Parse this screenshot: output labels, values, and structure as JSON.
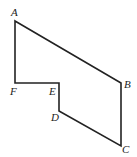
{
  "diagram": {
    "type": "polygon",
    "stroke_color": "#222222",
    "background": "#ffffff",
    "vertices": [
      {
        "id": "A",
        "label": "A",
        "x": 15,
        "y": 21,
        "lx": 11,
        "ly": 16
      },
      {
        "id": "B",
        "label": "B",
        "x": 121,
        "y": 83,
        "lx": 124,
        "ly": 88
      },
      {
        "id": "C",
        "label": "C",
        "x": 121,
        "y": 146,
        "lx": 122,
        "ly": 153
      },
      {
        "id": "D",
        "label": "D",
        "x": 59,
        "y": 111,
        "lx": 51,
        "ly": 121
      },
      {
        "id": "E",
        "label": "E",
        "x": 59,
        "y": 83,
        "lx": 49,
        "ly": 95
      },
      {
        "id": "F",
        "label": "F",
        "x": 15,
        "y": 83,
        "lx": 10,
        "ly": 95
      }
    ],
    "edges": [
      [
        "A",
        "B"
      ],
      [
        "B",
        "C"
      ],
      [
        "C",
        "D"
      ],
      [
        "D",
        "E"
      ],
      [
        "E",
        "F"
      ],
      [
        "F",
        "A"
      ]
    ]
  }
}
